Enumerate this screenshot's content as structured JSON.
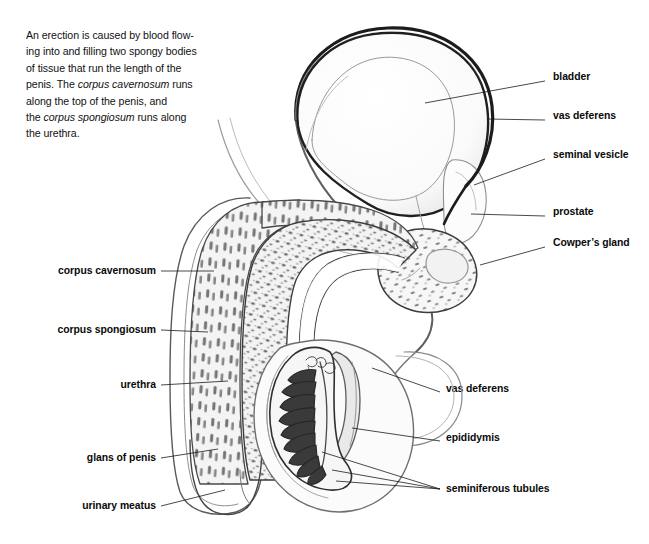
{
  "figure": {
    "background_color": "#ffffff",
    "ink_color": "#1a1a1a",
    "medium": "pencil drawing"
  },
  "caption": {
    "line1": "An erection is caused by blood flow-",
    "line2": "ing into and filling two spongy bodies",
    "line3": "of tissue that run the length of the",
    "line4_a": "penis. The ",
    "line4_i": "corpus cavernosum",
    "line4_b": " runs",
    "line5": "along the top of the penis, and",
    "line6_a": "the ",
    "line6_i": "corpus spongiosum",
    "line6_b": " runs along",
    "line7": "the urethra."
  },
  "labels": {
    "right": [
      {
        "id": "bladder",
        "text": "bladder",
        "x": 553,
        "y": 77,
        "leader": "M 545 81 L 425 103"
      },
      {
        "id": "vas-deferens-upper",
        "text": "vas deferens",
        "x": 553,
        "y": 116,
        "leader": "M 545 120 L 487 119"
      },
      {
        "id": "seminal-vesicle",
        "text": "seminal vesicle",
        "x": 553,
        "y": 155,
        "leader": "M 545 159 L 474 185"
      },
      {
        "id": "prostate",
        "text": "prostate",
        "x": 553,
        "y": 212,
        "leader": "M 545 216 L 471 214"
      },
      {
        "id": "cowpers-gland",
        "text": "Cowper’s gland",
        "x": 553,
        "y": 243,
        "leader": "M 545 247 L 480 265"
      },
      {
        "id": "vas-deferens-lower",
        "text": "vas deferens",
        "x": 446,
        "y": 389,
        "leader": "M 440 392 L 372 368"
      },
      {
        "id": "epididymis",
        "text": "epididymis",
        "x": 446,
        "y": 438,
        "leader": "M 440 441 L 352 428"
      },
      {
        "id": "seminiferous-tubules",
        "text": "seminiferous tubules",
        "x": 446,
        "y": 489,
        "leader": "M 440 489 L 322 452 M 440 489 L 332 470 M 440 489 L 336 481"
      }
    ],
    "left": [
      {
        "id": "corpus-cavernosum",
        "text": "corpus cavernosum",
        "x": 156,
        "y": 271,
        "leader": "M 161 271 L 214 271"
      },
      {
        "id": "corpus-spongiosum",
        "text": "corpus spongiosum",
        "x": 156,
        "y": 330,
        "leader": "M 161 330 L 208 332"
      },
      {
        "id": "urethra",
        "text": "urethra",
        "x": 156,
        "y": 385,
        "leader": "M 161 385 L 228 381"
      },
      {
        "id": "glans-of-penis",
        "text": "glans of penis",
        "x": 156,
        "y": 458,
        "leader": "M 161 458 L 218 449"
      },
      {
        "id": "urinary-meatus",
        "text": "urinary meatus",
        "x": 156,
        "y": 506,
        "leader": "M 161 506 L 225 490"
      }
    ]
  },
  "structures": [
    "bladder",
    "vas deferens",
    "seminal vesicle",
    "prostate",
    "Cowper's gland",
    "epididymis",
    "testis",
    "seminiferous tubules",
    "corpus cavernosum",
    "corpus spongiosum",
    "urethra",
    "glans of penis",
    "urinary meatus",
    "scrotum"
  ]
}
